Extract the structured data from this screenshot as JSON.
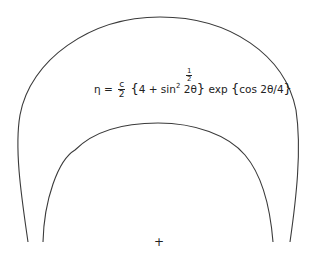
{
  "figure": {
    "formula": {
      "lhs": "η =",
      "coef_num": "c",
      "coef_den": "2",
      "open_brace": "{",
      "inner": "4 + sin",
      "sin_power": "2",
      "arg": " 2θ",
      "close_brace": "}",
      "power_num": "1",
      "power_den": "2",
      "exp_part": " exp ",
      "exp_open": "{",
      "exp_arg": "cos 2θ/4",
      "exp_close": "}"
    },
    "origin_marker": "+",
    "curves": [
      "outer-contour",
      "inner-contour"
    ]
  }
}
